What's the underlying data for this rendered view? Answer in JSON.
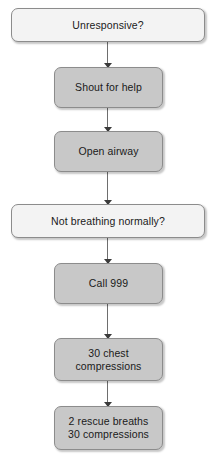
{
  "diagram": {
    "type": "flowchart",
    "orientation": "vertical",
    "canvas": {
      "width": 216,
      "height": 457,
      "background": "#ffffff"
    },
    "colors": {
      "light_node_fill": "#f3f3f3",
      "shaded_node_fill": "#c8c8c8",
      "node_border": "#8c8c8c",
      "connector": "#6e6e6e",
      "arrowhead": "#3a3a3a",
      "text": "#1a1a1a"
    },
    "nodes": [
      {
        "id": "unresponsive",
        "label": "Unresponsive?",
        "shape": "rounded-rect",
        "style": "light",
        "width": "wide",
        "x": 11,
        "y": 8,
        "w": 194,
        "h": 34
      },
      {
        "id": "shout-for-help",
        "label": "Shout for help",
        "shape": "rounded-rect",
        "style": "shaded",
        "width": "narrow",
        "x": 54,
        "y": 67,
        "w": 109,
        "h": 41
      },
      {
        "id": "open-airway",
        "label": "Open airway",
        "shape": "rounded-rect",
        "style": "shaded",
        "width": "narrow",
        "x": 54,
        "y": 131,
        "w": 109,
        "h": 41
      },
      {
        "id": "not-breathing-normally",
        "label": "Not breathing normally?",
        "shape": "rounded-rect",
        "style": "light",
        "width": "wide",
        "x": 11,
        "y": 204,
        "w": 194,
        "h": 34
      },
      {
        "id": "call-999",
        "label": "Call 999",
        "shape": "rounded-rect",
        "style": "shaded",
        "width": "narrow",
        "x": 54,
        "y": 263,
        "w": 109,
        "h": 41
      },
      {
        "id": "chest-compressions",
        "label": "30 chest\ncompressions",
        "shape": "rounded-rect",
        "style": "shaded",
        "width": "narrow",
        "x": 54,
        "y": 338,
        "w": 109,
        "h": 43
      },
      {
        "id": "rescue-breaths-compressions",
        "label": "2 rescue breaths\n30 compressions",
        "shape": "rounded-rect",
        "style": "shaded",
        "width": "narrow",
        "x": 54,
        "y": 406,
        "w": 109,
        "h": 44
      }
    ],
    "connectors": [
      {
        "id": "c1",
        "from": "unresponsive",
        "to": "shout-for-help",
        "y": 42,
        "h": 25,
        "arrowhead": true
      },
      {
        "id": "c2",
        "from": "shout-for-help",
        "to": "open-airway",
        "y": 108,
        "h": 23,
        "arrowhead": true
      },
      {
        "id": "c3",
        "from": "open-airway",
        "to": "not-breathing-normally",
        "y": 172,
        "h": 32,
        "arrowhead": true
      },
      {
        "id": "c4",
        "from": "not-breathing-normally",
        "to": "call-999",
        "y": 238,
        "h": 25,
        "arrowhead": true
      },
      {
        "id": "c5",
        "from": "call-999",
        "to": "chest-compressions",
        "y": 304,
        "h": 34,
        "arrowhead": true
      },
      {
        "id": "c6",
        "from": "chest-compressions",
        "to": "rescue-breaths-compressions",
        "y": 381,
        "h": 25,
        "arrowhead": true
      }
    ]
  }
}
